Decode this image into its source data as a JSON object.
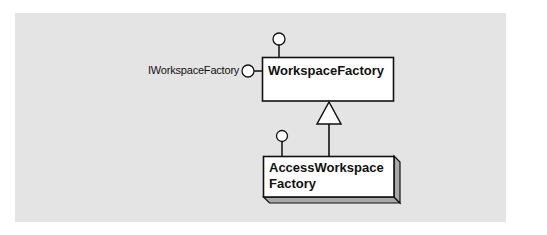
{
  "diagram": {
    "type": "UML class diagram",
    "background_color": "#e4e4e4",
    "line_color": "#111111",
    "shadow_color": "#aaaaaa",
    "interfaces": [
      {
        "name": "IWorkspaceFactory",
        "attached_to": "WorkspaceFactory",
        "side": "left",
        "labeled": true
      },
      {
        "name": "",
        "attached_to": "WorkspaceFactory",
        "side": "top",
        "labeled": false
      },
      {
        "name": "",
        "attached_to": "AccessWorkspaceFactory",
        "side": "top",
        "labeled": false
      }
    ],
    "classes": [
      {
        "name": "WorkspaceFactory",
        "kind": "abstract"
      },
      {
        "name": "AccessWorkspaceFactory",
        "kind": "coclass",
        "display_lines": [
          "AccessWorkspace",
          "Factory"
        ]
      }
    ],
    "relationships": [
      {
        "type": "inheritance",
        "from": "AccessWorkspaceFactory",
        "to": "WorkspaceFactory"
      }
    ],
    "labels": {
      "interface_label": "IWorkspaceFactory",
      "class1": "WorkspaceFactory",
      "class2_line1": "AccessWorkspace",
      "class2_line2": "Factory"
    }
  }
}
